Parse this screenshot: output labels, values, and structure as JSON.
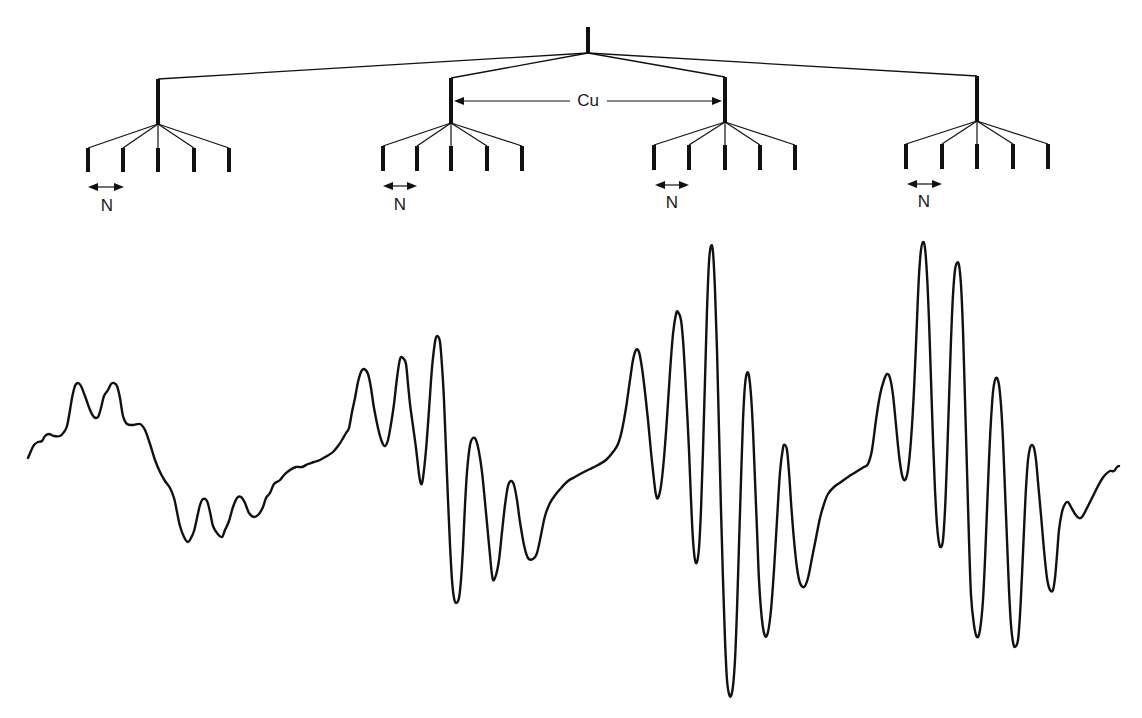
{
  "figure": {
    "ink_color": "#111111",
    "background": "#ffffff"
  },
  "tree": {
    "root": {
      "x": 588,
      "top": 27,
      "bottom": 53
    },
    "groups": [
      {
        "x": 158,
        "top": 79,
        "bottom": 124,
        "leaf_top": 148,
        "leaf_bottom": 172,
        "leaves": [
          88,
          123,
          158,
          194,
          229
        ],
        "n_arrow": {
          "x1": 88,
          "x2": 124,
          "y": 187
        },
        "n_label": {
          "x": 107,
          "y": 206,
          "text": "N"
        }
      },
      {
        "x": 451,
        "top": 78,
        "bottom": 123,
        "leaf_top": 146,
        "leaf_bottom": 171,
        "leaves": [
          383,
          417,
          451,
          487,
          522
        ],
        "n_arrow": {
          "x1": 383,
          "x2": 417,
          "y": 186
        },
        "n_label": {
          "x": 400,
          "y": 205,
          "text": "N"
        }
      },
      {
        "x": 725,
        "top": 77,
        "bottom": 122,
        "leaf_top": 145,
        "leaf_bottom": 170,
        "leaves": [
          654,
          689,
          725,
          760,
          795
        ],
        "n_arrow": {
          "x1": 655,
          "x2": 689,
          "y": 185
        },
        "n_label": {
          "x": 672,
          "y": 203,
          "text": "N"
        }
      },
      {
        "x": 977,
        "top": 76,
        "bottom": 121,
        "leaf_top": 144,
        "leaf_bottom": 169,
        "leaves": [
          906,
          942,
          977,
          1013,
          1048
        ],
        "n_arrow": {
          "x1": 907,
          "x2": 942,
          "y": 184
        },
        "n_label": {
          "x": 924,
          "y": 202,
          "text": "N"
        }
      }
    ],
    "cu_arrow": {
      "x1": 454,
      "x2": 722,
      "y": 101,
      "gap_start": 570,
      "gap_end": 607
    },
    "cu_label": {
      "x": 588,
      "y": 101,
      "text": "Cu"
    }
  },
  "labels": {
    "coupling_cu": "Cu",
    "coupling_n": "N"
  },
  "spectrum": {
    "stroke_width": 2.4,
    "points": [
      [
        28,
        458
      ],
      [
        31,
        451
      ],
      [
        34,
        445
      ],
      [
        38,
        442
      ],
      [
        42,
        441
      ],
      [
        45,
        436
      ],
      [
        49,
        434
      ],
      [
        54,
        436
      ],
      [
        60,
        436
      ],
      [
        64,
        432
      ],
      [
        67,
        426
      ],
      [
        70,
        410
      ],
      [
        72,
        398
      ],
      [
        75,
        386
      ],
      [
        78,
        383
      ],
      [
        81,
        386
      ],
      [
        85,
        396
      ],
      [
        90,
        410
      ],
      [
        94,
        417
      ],
      [
        98,
        417
      ],
      [
        101,
        408
      ],
      [
        104,
        396
      ],
      [
        108,
        390
      ],
      [
        111,
        384
      ],
      [
        114,
        383
      ],
      [
        117,
        386
      ],
      [
        120,
        398
      ],
      [
        123,
        416
      ],
      [
        127,
        424
      ],
      [
        133,
        425
      ],
      [
        140,
        424
      ],
      [
        145,
        430
      ],
      [
        150,
        444
      ],
      [
        155,
        460
      ],
      [
        160,
        472
      ],
      [
        165,
        481
      ],
      [
        170,
        488
      ],
      [
        174,
        498
      ],
      [
        177,
        512
      ],
      [
        180,
        526
      ],
      [
        184,
        537
      ],
      [
        188,
        542
      ],
      [
        191,
        538
      ],
      [
        194,
        531
      ],
      [
        197,
        518
      ],
      [
        200,
        505
      ],
      [
        203,
        499
      ],
      [
        207,
        501
      ],
      [
        210,
        512
      ],
      [
        213,
        526
      ],
      [
        217,
        533
      ],
      [
        222,
        537
      ],
      [
        225,
        530
      ],
      [
        229,
        521
      ],
      [
        233,
        507
      ],
      [
        237,
        498
      ],
      [
        241,
        497
      ],
      [
        245,
        503
      ],
      [
        249,
        513
      ],
      [
        254,
        517
      ],
      [
        259,
        514
      ],
      [
        263,
        507
      ],
      [
        266,
        498
      ],
      [
        270,
        493
      ],
      [
        274,
        484
      ],
      [
        280,
        480
      ],
      [
        285,
        474
      ],
      [
        290,
        470
      ],
      [
        296,
        467
      ],
      [
        302,
        467
      ],
      [
        308,
        464
      ],
      [
        314,
        462
      ],
      [
        320,
        460
      ],
      [
        327,
        456
      ],
      [
        333,
        452
      ],
      [
        338,
        446
      ],
      [
        342,
        440
      ],
      [
        346,
        433
      ],
      [
        349,
        428
      ],
      [
        352,
        412
      ],
      [
        355,
        398
      ],
      [
        358,
        382
      ],
      [
        361,
        372
      ],
      [
        364,
        369
      ],
      [
        368,
        374
      ],
      [
        371,
        388
      ],
      [
        374,
        408
      ],
      [
        378,
        428
      ],
      [
        382,
        442
      ],
      [
        385,
        446
      ],
      [
        388,
        440
      ],
      [
        391,
        424
      ],
      [
        394,
        404
      ],
      [
        397,
        378
      ],
      [
        400,
        359
      ],
      [
        403,
        358
      ],
      [
        406,
        364
      ],
      [
        408,
        384
      ],
      [
        410,
        404
      ],
      [
        413,
        426
      ],
      [
        416,
        448
      ],
      [
        419,
        474
      ],
      [
        421,
        484
      ],
      [
        423,
        478
      ],
      [
        426,
        450
      ],
      [
        429,
        410
      ],
      [
        432,
        368
      ],
      [
        435,
        342
      ],
      [
        437,
        336
      ],
      [
        440,
        342
      ],
      [
        442,
        366
      ],
      [
        444,
        400
      ],
      [
        446,
        450
      ],
      [
        448,
        500
      ],
      [
        450,
        545
      ],
      [
        452,
        580
      ],
      [
        454,
        598
      ],
      [
        456,
        603
      ],
      [
        459,
        598
      ],
      [
        461,
        580
      ],
      [
        463,
        548
      ],
      [
        465,
        505
      ],
      [
        467,
        472
      ],
      [
        470,
        445
      ],
      [
        473,
        438
      ],
      [
        476,
        440
      ],
      [
        479,
        452
      ],
      [
        482,
        472
      ],
      [
        485,
        502
      ],
      [
        488,
        534
      ],
      [
        491,
        566
      ],
      [
        493,
        580
      ],
      [
        496,
        575
      ],
      [
        499,
        560
      ],
      [
        502,
        532
      ],
      [
        505,
        505
      ],
      [
        508,
        486
      ],
      [
        511,
        481
      ],
      [
        514,
        485
      ],
      [
        517,
        500
      ],
      [
        520,
        522
      ],
      [
        524,
        545
      ],
      [
        528,
        558
      ],
      [
        533,
        559
      ],
      [
        537,
        553
      ],
      [
        541,
        535
      ],
      [
        545,
        516
      ],
      [
        550,
        503
      ],
      [
        556,
        494
      ],
      [
        562,
        487
      ],
      [
        568,
        481
      ],
      [
        575,
        477
      ],
      [
        582,
        473
      ],
      [
        590,
        469
      ],
      [
        598,
        465
      ],
      [
        606,
        460
      ],
      [
        613,
        452
      ],
      [
        618,
        444
      ],
      [
        622,
        430
      ],
      [
        626,
        408
      ],
      [
        630,
        380
      ],
      [
        633,
        360
      ],
      [
        636,
        350
      ],
      [
        639,
        352
      ],
      [
        642,
        368
      ],
      [
        645,
        392
      ],
      [
        648,
        420
      ],
      [
        651,
        452
      ],
      [
        654,
        480
      ],
      [
        656,
        495
      ],
      [
        658,
        498
      ],
      [
        661,
        486
      ],
      [
        664,
        458
      ],
      [
        667,
        418
      ],
      [
        670,
        372
      ],
      [
        673,
        334
      ],
      [
        676,
        314
      ],
      [
        678,
        312
      ],
      [
        681,
        320
      ],
      [
        683,
        340
      ],
      [
        685,
        372
      ],
      [
        687,
        410
      ],
      [
        689,
        450
      ],
      [
        691,
        500
      ],
      [
        693,
        540
      ],
      [
        695,
        560
      ],
      [
        697,
        562
      ],
      [
        699,
        548
      ],
      [
        701,
        510
      ],
      [
        703,
        450
      ],
      [
        705,
        380
      ],
      [
        707,
        310
      ],
      [
        709,
        262
      ],
      [
        711,
        246
      ],
      [
        713,
        252
      ],
      [
        715,
        290
      ],
      [
        717,
        350
      ],
      [
        719,
        430
      ],
      [
        721,
        510
      ],
      [
        723,
        580
      ],
      [
        725,
        640
      ],
      [
        727,
        680
      ],
      [
        729,
        694
      ],
      [
        731,
        696
      ],
      [
        733,
        686
      ],
      [
        735,
        660
      ],
      [
        737,
        610
      ],
      [
        739,
        545
      ],
      [
        741,
        480
      ],
      [
        743,
        420
      ],
      [
        745,
        385
      ],
      [
        747,
        373
      ],
      [
        749,
        376
      ],
      [
        751,
        395
      ],
      [
        753,
        430
      ],
      [
        755,
        480
      ],
      [
        757,
        530
      ],
      [
        759,
        580
      ],
      [
        762,
        620
      ],
      [
        765,
        636
      ],
      [
        768,
        632
      ],
      [
        771,
        610
      ],
      [
        774,
        570
      ],
      [
        777,
        520
      ],
      [
        780,
        472
      ],
      [
        783,
        448
      ],
      [
        785,
        445
      ],
      [
        787,
        450
      ],
      [
        789,
        472
      ],
      [
        791,
        502
      ],
      [
        794,
        540
      ],
      [
        797,
        568
      ],
      [
        800,
        583
      ],
      [
        804,
        587
      ],
      [
        808,
        578
      ],
      [
        812,
        558
      ],
      [
        816,
        538
      ],
      [
        820,
        518
      ],
      [
        824,
        504
      ],
      [
        828,
        494
      ],
      [
        834,
        487
      ],
      [
        841,
        482
      ],
      [
        848,
        477
      ],
      [
        856,
        472
      ],
      [
        864,
        467
      ],
      [
        868,
        464
      ],
      [
        872,
        450
      ],
      [
        876,
        420
      ],
      [
        880,
        395
      ],
      [
        884,
        380
      ],
      [
        887,
        374
      ],
      [
        890,
        378
      ],
      [
        893,
        395
      ],
      [
        896,
        425
      ],
      [
        899,
        455
      ],
      [
        902,
        475
      ],
      [
        905,
        480
      ],
      [
        908,
        470
      ],
      [
        911,
        440
      ],
      [
        914,
        390
      ],
      [
        917,
        320
      ],
      [
        919,
        275
      ],
      [
        921,
        250
      ],
      [
        923,
        242
      ],
      [
        925,
        248
      ],
      [
        927,
        275
      ],
      [
        929,
        320
      ],
      [
        931,
        380
      ],
      [
        933,
        440
      ],
      [
        935,
        490
      ],
      [
        937,
        525
      ],
      [
        939,
        543
      ],
      [
        941,
        547
      ],
      [
        943,
        540
      ],
      [
        945,
        510
      ],
      [
        947,
        460
      ],
      [
        949,
        400
      ],
      [
        951,
        340
      ],
      [
        953,
        295
      ],
      [
        955,
        270
      ],
      [
        957,
        263
      ],
      [
        959,
        265
      ],
      [
        961,
        285
      ],
      [
        963,
        330
      ],
      [
        965,
        400
      ],
      [
        967,
        470
      ],
      [
        969,
        540
      ],
      [
        971,
        595
      ],
      [
        974,
        625
      ],
      [
        977,
        637
      ],
      [
        980,
        630
      ],
      [
        983,
        600
      ],
      [
        985,
        560
      ],
      [
        987,
        510
      ],
      [
        989,
        460
      ],
      [
        991,
        420
      ],
      [
        993,
        392
      ],
      [
        995,
        380
      ],
      [
        997,
        378
      ],
      [
        999,
        385
      ],
      [
        1001,
        405
      ],
      [
        1003,
        440
      ],
      [
        1005,
        490
      ],
      [
        1007,
        540
      ],
      [
        1009,
        590
      ],
      [
        1011,
        625
      ],
      [
        1013,
        642
      ],
      [
        1015,
        647
      ],
      [
        1018,
        640
      ],
      [
        1020,
        615
      ],
      [
        1022,
        575
      ],
      [
        1024,
        530
      ],
      [
        1026,
        488
      ],
      [
        1028,
        460
      ],
      [
        1030,
        448
      ],
      [
        1032,
        445
      ],
      [
        1034,
        448
      ],
      [
        1036,
        460
      ],
      [
        1038,
        482
      ],
      [
        1041,
        515
      ],
      [
        1044,
        550
      ],
      [
        1047,
        578
      ],
      [
        1050,
        590
      ],
      [
        1053,
        590
      ],
      [
        1055,
        578
      ],
      [
        1057,
        555
      ],
      [
        1059,
        530
      ],
      [
        1062,
        512
      ],
      [
        1065,
        504
      ],
      [
        1068,
        502
      ],
      [
        1071,
        507
      ],
      [
        1075,
        514
      ],
      [
        1079,
        518
      ],
      [
        1082,
        517
      ],
      [
        1086,
        510
      ],
      [
        1090,
        502
      ],
      [
        1094,
        494
      ],
      [
        1098,
        486
      ],
      [
        1102,
        479
      ],
      [
        1106,
        474
      ],
      [
        1110,
        471
      ],
      [
        1114,
        471
      ],
      [
        1117,
        467
      ],
      [
        1119,
        466
      ]
    ]
  }
}
